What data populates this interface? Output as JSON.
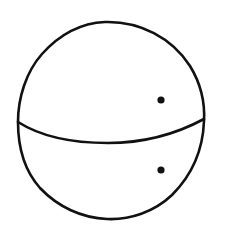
{
  "diagram": {
    "type": "sphere-sketch",
    "background": "#ffffff",
    "stroke_color": "#111111",
    "stroke_width": 2.6,
    "sphere": {
      "left": 18,
      "right": 204,
      "top": 22,
      "bottom": 219
    },
    "equator": {
      "left": [
        18,
        122
      ],
      "right": [
        204,
        119
      ],
      "lowest": [
        110,
        143
      ]
    },
    "points": [
      {
        "name": "upper-point",
        "x": 161,
        "y": 100,
        "r": 3.6
      },
      {
        "name": "lower-point",
        "x": 161,
        "y": 170,
        "r": 3.6
      }
    ]
  }
}
